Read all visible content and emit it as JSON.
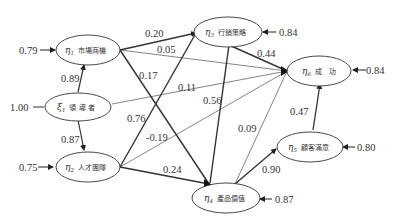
{
  "diagram": {
    "type": "path-diagram",
    "nodes": [
      {
        "id": "xi1",
        "symbol": "ξ",
        "sub": "1",
        "label": "領 導 者",
        "error": "1.00"
      },
      {
        "id": "eta1",
        "symbol": "η",
        "sub": "1",
        "label": "市場商機",
        "error": "0.79"
      },
      {
        "id": "eta2",
        "symbol": "η",
        "sub": "2",
        "label": "人才團隊",
        "error": "0.75"
      },
      {
        "id": "eta3",
        "symbol": "η",
        "sub": "3",
        "label": "行銷策略",
        "error": "0.84"
      },
      {
        "id": "eta4",
        "symbol": "η",
        "sub": "4",
        "label": "產品價值",
        "error": "0.87"
      },
      {
        "id": "eta5",
        "symbol": "η",
        "sub": "5",
        "label": "顧客滿意",
        "error": "0.80"
      },
      {
        "id": "eta6",
        "symbol": "η",
        "sub": "6",
        "label": "成　功",
        "error": "0.84"
      }
    ],
    "edges": [
      {
        "from": "xi1",
        "to": "eta1",
        "coef": "0.89"
      },
      {
        "from": "xi1",
        "to": "eta2",
        "coef": "0.87"
      },
      {
        "from": "xi1",
        "to": "eta6",
        "coef": "0.11"
      },
      {
        "from": "eta1",
        "to": "eta3",
        "coef": "0.20"
      },
      {
        "from": "eta1",
        "to": "eta6",
        "coef": "0.05"
      },
      {
        "from": "eta1",
        "to": "eta4",
        "coef": "0.17"
      },
      {
        "from": "eta2",
        "to": "eta3",
        "coef": "0.76"
      },
      {
        "from": "eta2",
        "to": "eta6",
        "coef": "-0.19"
      },
      {
        "from": "eta2",
        "to": "eta4",
        "coef": "0.24"
      },
      {
        "from": "eta3",
        "to": "eta6",
        "coef": "0.44"
      },
      {
        "from": "eta3",
        "to": "eta4",
        "coef": "0.56"
      },
      {
        "from": "eta4",
        "to": "eta6",
        "coef": "0.09"
      },
      {
        "from": "eta4",
        "to": "eta5",
        "coef": "0.90"
      },
      {
        "from": "eta5",
        "to": "eta6",
        "coef": "0.47"
      }
    ]
  }
}
